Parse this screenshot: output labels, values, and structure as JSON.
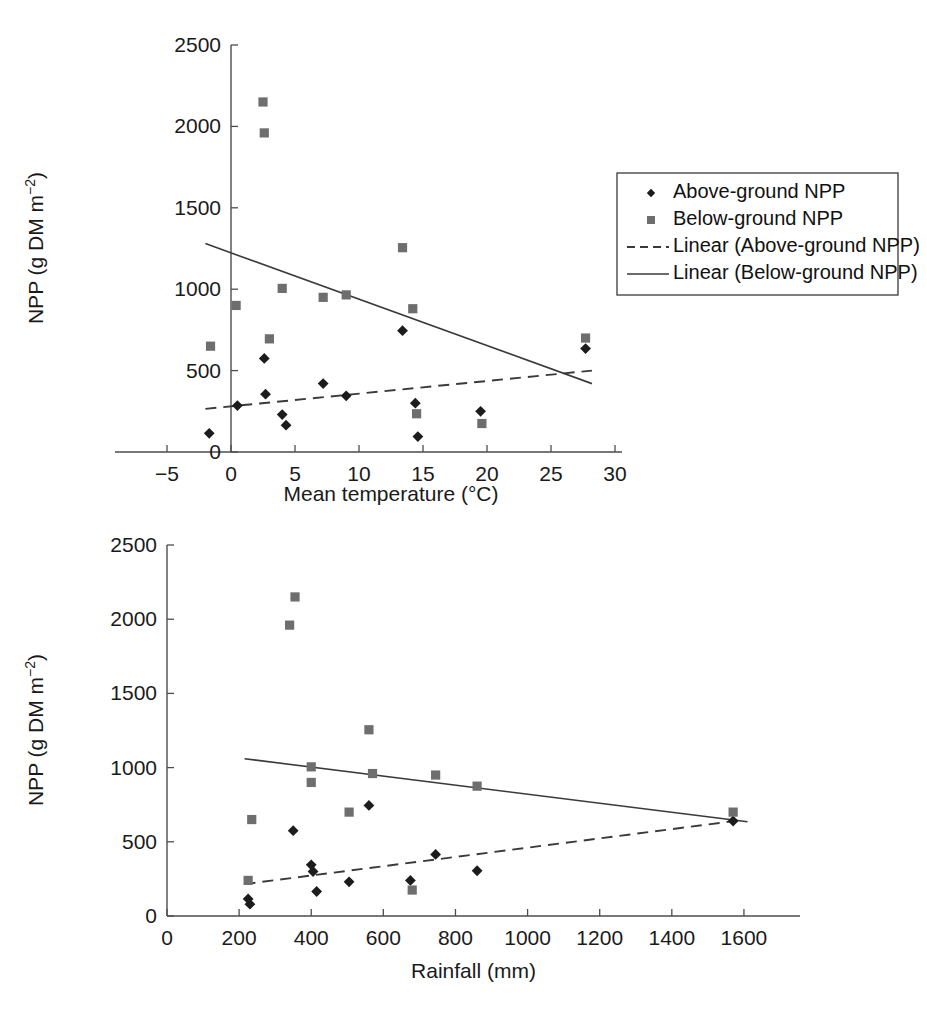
{
  "figure": {
    "ylabel_main": "NPP (g DM m",
    "ylabel_sup": "−2",
    "ylabel_close": ")"
  },
  "legend": {
    "items": [
      {
        "label": "Above-ground NPP",
        "marker": "diamond-marker",
        "color": "#1c1c1c"
      },
      {
        "label": "Below-ground NPP",
        "marker": "square-marker",
        "color": "#6e6e6e"
      },
      {
        "label": "Linear (Above-ground NPP)",
        "marker": "dashed-line",
        "color": "#3a3a3a"
      },
      {
        "label": "Linear (Below-ground NPP)",
        "marker": "solid-line",
        "color": "#3a3a3a"
      }
    ]
  },
  "chart_data": [
    {
      "type": "scatter",
      "id": "npp-vs-temperature",
      "title": "",
      "xlabel": "Mean temperature (°C)",
      "ylabel": "NPP (g DM m−2)",
      "xlim": [
        -5,
        30
      ],
      "ylim": [
        0,
        2500
      ],
      "xticks": [
        -5,
        0,
        5,
        10,
        15,
        20,
        25,
        30
      ],
      "xticklabels": [
        "−5",
        "0",
        "5",
        "10",
        "15",
        "20",
        "25",
        "30"
      ],
      "yticks": [
        0,
        500,
        1000,
        1500,
        2000,
        2500
      ],
      "yticklabels": [
        "0",
        "500",
        "1000",
        "1500",
        "2000",
        "2500"
      ],
      "grid": false,
      "legend_position": "outside-right",
      "series": [
        {
          "name": "Above-ground NPP",
          "marker": "diamond",
          "color": "#1c1c1c",
          "points": [
            [
              -1.7,
              115
            ],
            [
              0.5,
              285
            ],
            [
              2.6,
              575
            ],
            [
              2.7,
              355
            ],
            [
              4.0,
              230
            ],
            [
              4.3,
              165
            ],
            [
              7.2,
              420
            ],
            [
              9.0,
              345
            ],
            [
              13.4,
              745
            ],
            [
              14.4,
              300
            ],
            [
              14.6,
              95
            ],
            [
              19.5,
              250
            ],
            [
              27.7,
              635
            ]
          ]
        },
        {
          "name": "Below-ground NPP",
          "marker": "square",
          "color": "#6e6e6e",
          "points": [
            [
              -1.6,
              650
            ],
            [
              0.4,
              900
            ],
            [
              2.5,
              2150
            ],
            [
              2.6,
              1960
            ],
            [
              3.0,
              695
            ],
            [
              4.0,
              1005
            ],
            [
              7.2,
              950
            ],
            [
              9.0,
              965
            ],
            [
              13.4,
              1255
            ],
            [
              14.2,
              880
            ],
            [
              14.5,
              235
            ],
            [
              19.6,
              175
            ],
            [
              27.7,
              700
            ]
          ]
        }
      ],
      "trendlines": [
        {
          "name": "Linear (Above-ground NPP)",
          "style": "dashed",
          "x0": -2.0,
          "y0": 265,
          "x1": 28.2,
          "y1": 500
        },
        {
          "name": "Linear (Below-ground NPP)",
          "style": "solid",
          "x0": -2.0,
          "y0": 1280,
          "x1": 28.2,
          "y1": 420
        }
      ]
    },
    {
      "type": "scatter",
      "id": "npp-vs-rainfall",
      "title": "",
      "xlabel": "Rainfall (mm)",
      "ylabel": "NPP (g DM m−2)",
      "xlim": [
        0,
        1700
      ],
      "ylim": [
        0,
        2500
      ],
      "xticks": [
        0,
        200,
        400,
        600,
        800,
        1000,
        1200,
        1400,
        1600
      ],
      "xticklabels": [
        "0",
        "200",
        "400",
        "600",
        "800",
        "1000",
        "1200",
        "1400",
        "1600"
      ],
      "yticks": [
        0,
        500,
        1000,
        1500,
        2000,
        2500
      ],
      "yticklabels": [
        "0",
        "500",
        "1000",
        "1500",
        "2000",
        "2500"
      ],
      "grid": false,
      "legend_position": "none",
      "series": [
        {
          "name": "Above-ground NPP",
          "marker": "diamond",
          "color": "#1c1c1c",
          "points": [
            [
              225,
              115
            ],
            [
              230,
              80
            ],
            [
              350,
              575
            ],
            [
              400,
              345
            ],
            [
              405,
              300
            ],
            [
              415,
              165
            ],
            [
              505,
              230
            ],
            [
              560,
              745
            ],
            [
              675,
              240
            ],
            [
              745,
              415
            ],
            [
              860,
              305
            ],
            [
              1570,
              640
            ]
          ]
        },
        {
          "name": "Below-ground NPP",
          "marker": "square",
          "color": "#6e6e6e",
          "points": [
            [
              225,
              240
            ],
            [
              235,
              650
            ],
            [
              355,
              2150
            ],
            [
              340,
              1960
            ],
            [
              400,
              1005
            ],
            [
              400,
              900
            ],
            [
              505,
              700
            ],
            [
              560,
              1255
            ],
            [
              570,
              960
            ],
            [
              680,
              175
            ],
            [
              745,
              950
            ],
            [
              860,
              875
            ],
            [
              1570,
              700
            ]
          ]
        }
      ],
      "trendlines": [
        {
          "name": "Linear (Above-ground NPP)",
          "style": "dashed",
          "x0": 215,
          "y0": 215,
          "x1": 1590,
          "y1": 645
        },
        {
          "name": "Linear (Below-ground NPP)",
          "style": "solid",
          "x0": 215,
          "y0": 1060,
          "x1": 1610,
          "y1": 635
        }
      ]
    }
  ]
}
